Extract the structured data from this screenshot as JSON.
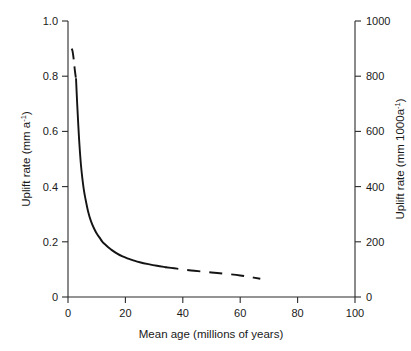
{
  "chart_data": {
    "type": "line",
    "title": "",
    "subtitle": "",
    "xlabel": "Mean age (millions of years)",
    "ylabel": "Uplift rate (mm a",
    "ylabel_sup": "-1",
    "ylabel_tail": ")",
    "y2label": "Uplift rate (mm 1000a",
    "y2label_sup": "-1",
    "y2label_tail": ")",
    "xlim": [
      0,
      100
    ],
    "ylim": [
      0,
      1.0
    ],
    "y2lim": [
      0,
      1000
    ],
    "grid": false,
    "legend": "none",
    "xticks": [
      "0",
      "20",
      "40",
      "60",
      "80",
      "100"
    ],
    "xtick_values": [
      0,
      20,
      40,
      60,
      80,
      100
    ],
    "yticks": [
      "0",
      "0.2",
      "0.4",
      "0.6",
      "0.8",
      "1.0"
    ],
    "ytick_values": [
      0,
      0.2,
      0.4,
      0.6,
      0.8,
      1.0
    ],
    "y2ticks": [
      "0",
      "200",
      "400",
      "600",
      "800",
      "1000"
    ],
    "y2tick_values": [
      0,
      200,
      400,
      600,
      800,
      1000
    ],
    "series": [
      {
        "name": "Uplift rate vs mean age",
        "style": "mixed solid and dashed",
        "color": "#141414",
        "x": [
          1.3,
          1.6,
          2.0,
          2.4,
          2.8,
          3.2,
          3.6,
          4.0,
          4.5,
          5.0,
          5.5,
          6.0,
          7.0,
          8.0,
          9.0,
          10.0,
          11.0,
          12.0,
          13.0,
          14.0,
          15.0,
          17.0,
          19.0,
          21.0,
          23.0,
          25.0,
          28.0,
          31.0,
          34.0,
          37.0,
          40.0,
          44.0,
          48.0,
          52.0,
          56.0,
          60.0,
          63.0,
          67.0
        ],
        "y": [
          0.9,
          0.89,
          0.86,
          0.82,
          0.79,
          0.7,
          0.62,
          0.55,
          0.48,
          0.43,
          0.39,
          0.36,
          0.31,
          0.275,
          0.25,
          0.23,
          0.215,
          0.2,
          0.19,
          0.18,
          0.172,
          0.158,
          0.147,
          0.139,
          0.132,
          0.126,
          0.119,
          0.113,
          0.108,
          0.104,
          0.1,
          0.095,
          0.091,
          0.087,
          0.083,
          0.078,
          0.073,
          0.066
        ],
        "segments": [
          {
            "kind": "dashed",
            "x_from": 1.3,
            "x_to": 2.8,
            "note": "upper extrapolated dashed segment"
          },
          {
            "kind": "solid",
            "x_from": 2.8,
            "x_to": 34.0,
            "note": "main solid curve"
          },
          {
            "kind": "dashed",
            "x_from": 34.0,
            "x_to": 67.0,
            "note": "tail extrapolated dashed segment"
          }
        ]
      }
    ]
  },
  "figure": {
    "background": "#ffffff",
    "axis_color": "#2b2b2b",
    "curve_color": "#141414"
  }
}
